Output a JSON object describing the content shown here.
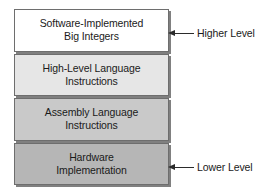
{
  "diagram": {
    "type": "layered-stack",
    "layers": [
      {
        "id": "software-implemented-big-integers",
        "line1": "Software-Implemented",
        "line2": "Big Integers",
        "fill": "#ffffff",
        "position": "top"
      },
      {
        "id": "high-level-language-instructions",
        "line1": "High-Level Language",
        "line2": "Instructions",
        "fill": "#e6e6e6",
        "position": "second"
      },
      {
        "id": "assembly-language-instructions",
        "line1": "Assembly Language",
        "line2": "Instructions",
        "fill": "#c9c9c9",
        "position": "third"
      },
      {
        "id": "hardware-implementation",
        "line1": "Hardware",
        "line2": "Implementation",
        "fill": "#b6b6b6",
        "position": "bottom"
      }
    ],
    "annotations": [
      {
        "id": "higher-level",
        "label": "Higher Level",
        "points_to": "software-implemented-big-integers",
        "arrow_direction": "left"
      },
      {
        "id": "lower-level",
        "label": "Lower Level",
        "points_to": "hardware-implementation",
        "arrow_direction": "left"
      }
    ],
    "colors": {
      "border": "#6e6e6e",
      "shadow": "#808080",
      "text": "#1a1a1a",
      "arrow": "#2b2b2b",
      "background": "#ffffff"
    }
  }
}
